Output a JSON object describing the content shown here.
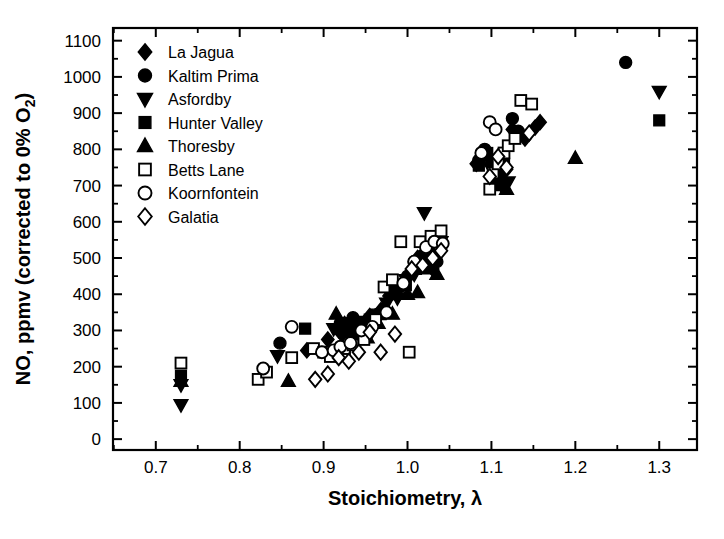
{
  "chart_data": {
    "type": "scatter",
    "title": "",
    "xlabel": "Stoichiometry,  λ",
    "ylabel": "NO, ppmv (corrected to 0% O₂)",
    "ylabel_main": "NO, ppmv (corrected to 0% O",
    "ylabel_sub": "2",
    "ylabel_tail": ")",
    "xlim": [
      0.649,
      1.345
    ],
    "ylim": [
      -30,
      1135
    ],
    "xticks": [
      0.7,
      0.8,
      0.9,
      1.0,
      1.1,
      1.2,
      1.3
    ],
    "xtick_labels": [
      "0.7",
      "0.8",
      "0.9",
      "1.0",
      "1.1",
      "1.2",
      "1.3"
    ],
    "xtick_minor_step": 0.05,
    "yticks": [
      0,
      100,
      200,
      300,
      400,
      500,
      600,
      700,
      800,
      900,
      1000,
      1100
    ],
    "ytick_labels": [
      "0",
      "100",
      "200",
      "300",
      "400",
      "500",
      "600",
      "700",
      "800",
      "900",
      "1000",
      "1100"
    ],
    "ytick_minor_step": 50,
    "grid": false,
    "legend_position": "top-left",
    "series": [
      {
        "name": "La Jagua",
        "marker": "diamond-filled",
        "color": "#000000",
        "points": [
          [
            0.88,
            245
          ],
          [
            0.905,
            275
          ],
          [
            0.918,
            300
          ],
          [
            0.925,
            318
          ],
          [
            0.93,
            300
          ],
          [
            0.935,
            330
          ],
          [
            0.948,
            300
          ],
          [
            0.955,
            340
          ],
          [
            0.968,
            355
          ],
          [
            0.978,
            395
          ],
          [
            0.985,
            415
          ],
          [
            0.995,
            430
          ],
          [
            1.012,
            500
          ],
          [
            1.022,
            520
          ],
          [
            1.03,
            470
          ],
          [
            1.038,
            540
          ],
          [
            1.082,
            760
          ],
          [
            1.098,
            775
          ],
          [
            1.108,
            735
          ],
          [
            1.112,
            720
          ],
          [
            1.118,
            745
          ],
          [
            1.125,
            855
          ],
          [
            1.14,
            830
          ],
          [
            1.152,
            860
          ],
          [
            1.158,
            875
          ]
        ]
      },
      {
        "name": "Kaltim Prima",
        "marker": "circle-filled",
        "color": "#000000",
        "points": [
          [
            0.848,
            265
          ],
          [
            0.92,
            320
          ],
          [
            0.928,
            310
          ],
          [
            0.935,
            335
          ],
          [
            0.94,
            290
          ],
          [
            0.952,
            305
          ],
          [
            0.96,
            330
          ],
          [
            0.972,
            360
          ],
          [
            0.99,
            420
          ],
          [
            1.0,
            450
          ],
          [
            1.008,
            490
          ],
          [
            1.018,
            505
          ],
          [
            1.028,
            540
          ],
          [
            1.035,
            490
          ],
          [
            1.085,
            770
          ],
          [
            1.092,
            800
          ],
          [
            1.1,
            760
          ],
          [
            1.105,
            720
          ],
          [
            1.125,
            885
          ],
          [
            1.132,
            850
          ],
          [
            1.26,
            1040
          ]
        ]
      },
      {
        "name": "Asfordby",
        "marker": "triangle-down-filled",
        "color": "#000000",
        "points": [
          [
            0.73,
            150
          ],
          [
            0.73,
            95
          ],
          [
            0.845,
            230
          ],
          [
            0.912,
            305
          ],
          [
            0.922,
            285
          ],
          [
            0.93,
            312
          ],
          [
            0.938,
            295
          ],
          [
            0.945,
            325
          ],
          [
            0.958,
            300
          ],
          [
            0.965,
            345
          ],
          [
            0.975,
            375
          ],
          [
            0.988,
            390
          ],
          [
            0.998,
            440
          ],
          [
            1.008,
            455
          ],
          [
            1.02,
            625
          ],
          [
            1.028,
            510
          ],
          [
            1.04,
            545
          ],
          [
            1.1,
            745
          ],
          [
            1.112,
            700
          ],
          [
            1.12,
            710
          ],
          [
            1.3,
            960
          ]
        ]
      },
      {
        "name": "Hunter Valley",
        "marker": "square-filled",
        "color": "#000000",
        "points": [
          [
            0.73,
            175
          ],
          [
            0.878,
            305
          ],
          [
            0.925,
            295
          ],
          [
            0.932,
            320
          ],
          [
            0.942,
            310
          ],
          [
            0.955,
            330
          ],
          [
            0.968,
            345
          ],
          [
            0.985,
            400
          ],
          [
            0.998,
            425
          ],
          [
            1.01,
            470
          ],
          [
            1.02,
            505
          ],
          [
            1.03,
            555
          ],
          [
            1.038,
            560
          ],
          [
            1.085,
            755
          ],
          [
            1.095,
            790
          ],
          [
            1.105,
            735
          ],
          [
            1.115,
            760
          ],
          [
            1.3,
            880
          ]
        ]
      },
      {
        "name": "Thoresby",
        "marker": "triangle-up-filled",
        "color": "#000000",
        "points": [
          [
            0.73,
            160
          ],
          [
            0.858,
            160
          ],
          [
            0.915,
            345
          ],
          [
            0.928,
            300
          ],
          [
            0.935,
            290
          ],
          [
            0.945,
            315
          ],
          [
            0.952,
            280
          ],
          [
            0.965,
            320
          ],
          [
            0.982,
            345
          ],
          [
            1.0,
            400
          ],
          [
            1.012,
            405
          ],
          [
            1.025,
            470
          ],
          [
            1.035,
            455
          ],
          [
            1.108,
            700
          ],
          [
            1.118,
            690
          ],
          [
            1.2,
            775
          ]
        ]
      },
      {
        "name": "Betts Lane",
        "marker": "square-open",
        "color": "#000000",
        "points": [
          [
            0.73,
            210
          ],
          [
            0.822,
            165
          ],
          [
            0.832,
            185
          ],
          [
            0.862,
            225
          ],
          [
            0.888,
            250
          ],
          [
            0.9,
            240
          ],
          [
            0.908,
            228
          ],
          [
            0.925,
            250
          ],
          [
            0.935,
            260
          ],
          [
            0.948,
            275
          ],
          [
            0.962,
            330
          ],
          [
            0.972,
            420
          ],
          [
            0.982,
            440
          ],
          [
            0.992,
            545
          ],
          [
            1.002,
            240
          ],
          [
            1.015,
            545
          ],
          [
            1.028,
            560
          ],
          [
            1.04,
            575
          ],
          [
            1.098,
            690
          ],
          [
            1.102,
            735
          ],
          [
            1.108,
            760
          ],
          [
            1.115,
            790
          ],
          [
            1.12,
            810
          ],
          [
            1.128,
            830
          ],
          [
            1.135,
            935
          ],
          [
            1.148,
            925
          ]
        ]
      },
      {
        "name": "Koornfontein",
        "marker": "circle-open",
        "color": "#000000",
        "points": [
          [
            0.828,
            195
          ],
          [
            0.862,
            310
          ],
          [
            0.898,
            240
          ],
          [
            0.912,
            245
          ],
          [
            0.92,
            255
          ],
          [
            0.932,
            265
          ],
          [
            0.945,
            300
          ],
          [
            0.958,
            310
          ],
          [
            0.975,
            350
          ],
          [
            0.995,
            430
          ],
          [
            1.008,
            490
          ],
          [
            1.022,
            530
          ],
          [
            1.032,
            545
          ],
          [
            1.042,
            540
          ],
          [
            1.088,
            790
          ],
          [
            1.098,
            875
          ],
          [
            1.105,
            855
          ]
        ]
      },
      {
        "name": "Galatia",
        "marker": "diamond-open",
        "color": "#000000",
        "points": [
          [
            0.89,
            165
          ],
          [
            0.905,
            180
          ],
          [
            0.918,
            225
          ],
          [
            0.93,
            215
          ],
          [
            0.942,
            240
          ],
          [
            0.955,
            295
          ],
          [
            0.968,
            240
          ],
          [
            0.985,
            290
          ],
          [
            1.005,
            470
          ],
          [
            1.018,
            480
          ],
          [
            1.03,
            500
          ],
          [
            1.04,
            520
          ],
          [
            1.098,
            725
          ],
          [
            1.108,
            780
          ],
          [
            1.118,
            750
          ],
          [
            1.145,
            845
          ]
        ]
      }
    ]
  },
  "legend": {
    "items": [
      {
        "label": "La Jagua",
        "marker": "diamond-filled"
      },
      {
        "label": "Kaltim Prima",
        "marker": "circle-filled"
      },
      {
        "label": "Asfordby",
        "marker": "triangle-down-filled"
      },
      {
        "label": "Hunter Valley",
        "marker": "square-filled"
      },
      {
        "label": "Thoresby",
        "marker": "triangle-up-filled"
      },
      {
        "label": "Betts Lane",
        "marker": "square-open"
      },
      {
        "label": "Koornfontein",
        "marker": "circle-open"
      },
      {
        "label": "Galatia",
        "marker": "diamond-open"
      }
    ]
  }
}
